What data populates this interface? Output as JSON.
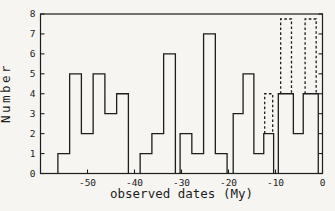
{
  "figure": {
    "background": "#f6f5f2",
    "line_color": "#1d1d1d",
    "text_color": "#1d1d1d"
  },
  "chart_data": {
    "type": "bar",
    "subtype": "step-outline-histogram",
    "title": "",
    "xlabel": "observed dates (My)",
    "ylabel": "Number",
    "xlim": [
      -60,
      0
    ],
    "ylim": [
      0,
      8
    ],
    "grid": false,
    "legend": "none",
    "bin_width_my": 2.5,
    "x_ticks": [
      -50,
      -40,
      -30,
      -20,
      -10,
      0
    ],
    "x_tick_labels": [
      "-50",
      "-40",
      "-30",
      "-20",
      "-10",
      "0"
    ],
    "y_ticks": [
      0,
      1,
      2,
      3,
      4,
      5,
      6,
      7,
      8
    ],
    "y_tick_labels": [
      "0",
      "1",
      "2",
      "3",
      "4",
      "5",
      "6",
      "7",
      "8"
    ],
    "solid_groups": [
      [
        {
          "from": -56.3,
          "to": -53.8,
          "count": 1
        },
        {
          "from": -53.8,
          "to": -51.3,
          "count": 5
        },
        {
          "from": -51.3,
          "to": -48.8,
          "count": 2
        },
        {
          "from": -48.8,
          "to": -46.3,
          "count": 5
        },
        {
          "from": -46.3,
          "to": -43.8,
          "count": 3
        },
        {
          "from": -43.8,
          "to": -41.3,
          "count": 4
        }
      ],
      [
        {
          "from": -38.8,
          "to": -36.3,
          "count": 1
        },
        {
          "from": -36.3,
          "to": -33.8,
          "count": 2
        },
        {
          "from": -33.8,
          "to": -31.3,
          "count": 6
        }
      ],
      [
        {
          "from": -30.3,
          "to": -27.8,
          "count": 2
        },
        {
          "from": -27.8,
          "to": -25.3,
          "count": 1
        },
        {
          "from": -25.3,
          "to": -22.8,
          "count": 7
        },
        {
          "from": -22.8,
          "to": -20.3,
          "count": 1
        }
      ],
      [
        {
          "from": -19.0,
          "to": -16.9,
          "count": 3
        },
        {
          "from": -16.9,
          "to": -14.6,
          "count": 5
        },
        {
          "from": -14.6,
          "to": -12.5,
          "count": 1
        },
        {
          "from": -12.5,
          "to": -10.4,
          "count": 2
        }
      ],
      [
        {
          "from": -9.4,
          "to": -6.2,
          "count": 4
        },
        {
          "from": -6.2,
          "to": -4.1,
          "count": 2
        },
        {
          "from": -4.1,
          "to": -0.9,
          "count": 4
        }
      ]
    ],
    "dashed_bars": [
      {
        "from": -12.3,
        "to": -10.6,
        "base": 2,
        "top": 4
      },
      {
        "from": -8.9,
        "to": -6.6,
        "base": 4,
        "top": 7.75
      },
      {
        "from": -3.7,
        "to": -1.35,
        "base": 4,
        "top": 7.75
      }
    ]
  }
}
